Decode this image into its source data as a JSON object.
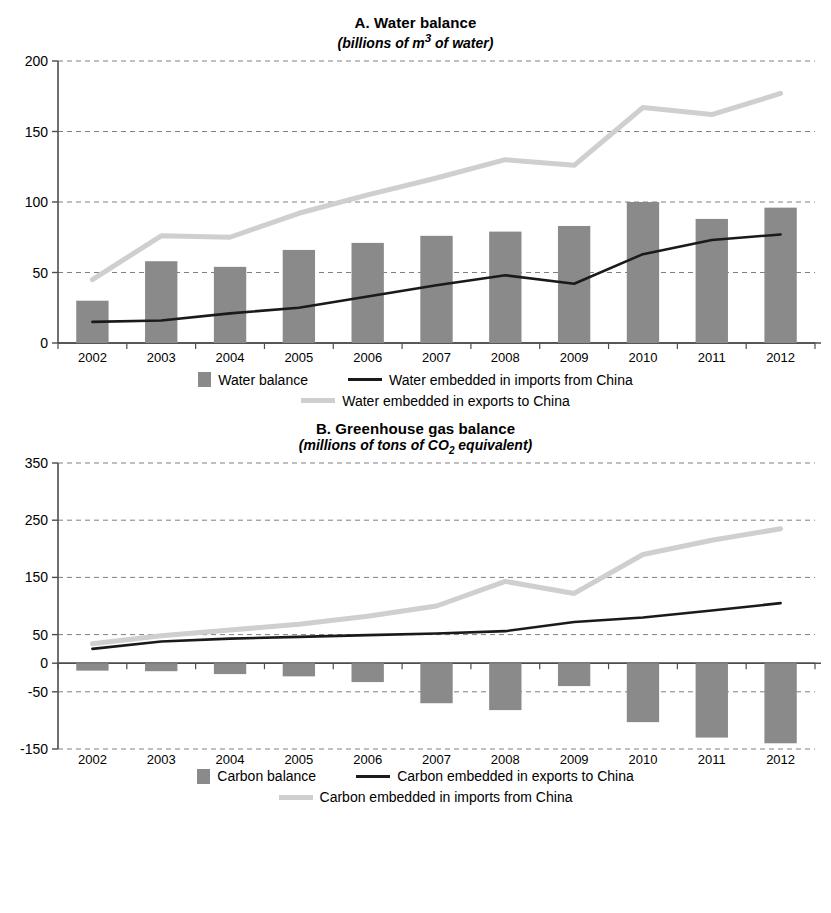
{
  "panels": [
    {
      "id": "panel-a",
      "title": "A. Water balance",
      "subtitle_pre": "(billions of m",
      "subtitle_sup": "3",
      "subtitle_post": " of water)",
      "legend": {
        "bar_label": "Water balance",
        "dark_line_label": "Water embedded in imports from China",
        "light_line_label": "Water embedded in exports to China"
      }
    },
    {
      "id": "panel-b",
      "title": "B. Greenhouse gas balance",
      "subtitle_pre": "(millions of tons of CO",
      "subtitle_sub": "2",
      "subtitle_post": " equivalent)",
      "legend": {
        "bar_label": "Carbon balance",
        "dark_line_label": "Carbon embedded in exports to China",
        "light_line_label": "Carbon embedded in imports from China"
      }
    }
  ],
  "colors": {
    "bar": "#8a8a8a",
    "dark_line": "#1a1a1a",
    "light_line": "#cfcfcf",
    "axis": "#4d4d4d",
    "grid": "#808080",
    "background": "#ffffff"
  },
  "chart_data": [
    {
      "type": "bar",
      "id": "water-balance",
      "title": "A. Water balance",
      "subtitle": "(billions of m3 of water)",
      "xlabel": "",
      "ylabel": "",
      "ylim": [
        0,
        200
      ],
      "yticks": [
        0,
        50,
        100,
        150,
        200
      ],
      "ytick_labels": [
        "0",
        "50",
        "100",
        "150",
        "200"
      ],
      "grid": true,
      "legend_position": "bottom",
      "categories": [
        "2002",
        "2003",
        "2004",
        "2005",
        "2006",
        "2007",
        "2008",
        "2009",
        "2010",
        "2011",
        "2012"
      ],
      "series": [
        {
          "name": "Water balance",
          "type": "bar",
          "color": "#8a8a8a",
          "values": [
            30,
            58,
            54,
            66,
            71,
            76,
            79,
            83,
            100,
            88,
            96
          ]
        },
        {
          "name": "Water embedded in imports from China",
          "type": "line",
          "color": "#1a1a1a",
          "values": [
            15,
            16,
            21,
            25,
            33,
            41,
            48,
            42,
            63,
            73,
            77
          ]
        },
        {
          "name": "Water embedded in exports to China",
          "type": "line",
          "color": "#cfcfcf",
          "values": [
            45,
            76,
            75,
            92,
            105,
            117,
            130,
            126,
            167,
            162,
            177
          ]
        }
      ]
    },
    {
      "type": "bar",
      "id": "greenhouse-gas-balance",
      "title": "B. Greenhouse gas balance",
      "subtitle": "(millions of tons of CO2 equivalent)",
      "xlabel": "",
      "ylabel": "",
      "ylim": [
        -150,
        350
      ],
      "yticks": [
        -150,
        -50,
        0,
        50,
        150,
        250,
        350
      ],
      "ytick_labels": [
        "-150",
        "-50",
        "0",
        "50",
        "150",
        "250",
        "350"
      ],
      "grid": true,
      "legend_position": "bottom",
      "categories": [
        "2002",
        "2003",
        "2004",
        "2005",
        "2006",
        "2007",
        "2008",
        "2009",
        "2010",
        "2011",
        "2012"
      ],
      "series": [
        {
          "name": "Carbon balance",
          "type": "bar",
          "color": "#8a8a8a",
          "values": [
            -13,
            -14,
            -19,
            -23,
            -33,
            -70,
            -82,
            -40,
            -103,
            -130,
            -140
          ]
        },
        {
          "name": "Carbon embedded in exports to China",
          "type": "line",
          "color": "#1a1a1a",
          "values": [
            25,
            38,
            43,
            46,
            49,
            52,
            56,
            72,
            80,
            92,
            105
          ]
        },
        {
          "name": "Carbon embedded in imports from China",
          "type": "line",
          "color": "#cfcfcf",
          "values": [
            34,
            48,
            58,
            68,
            82,
            100,
            143,
            122,
            190,
            215,
            235
          ]
        }
      ]
    }
  ]
}
